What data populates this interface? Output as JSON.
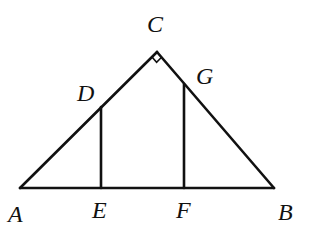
{
  "diagram": {
    "type": "geometry",
    "colors": {
      "stroke": "#111111",
      "background": "#ffffff"
    },
    "points": {
      "A": {
        "label": "A",
        "x": 20,
        "y": 188,
        "lx": 8,
        "ly": 222
      },
      "B": {
        "label": "B",
        "x": 274,
        "y": 188,
        "lx": 278,
        "ly": 220
      },
      "C": {
        "label": "C",
        "x": 157,
        "y": 52,
        "lx": 147,
        "ly": 32
      },
      "D": {
        "label": "D",
        "x": 101,
        "y": 107,
        "lx": 77,
        "ly": 101
      },
      "E": {
        "label": "E",
        "x": 101,
        "y": 188,
        "lx": 92,
        "ly": 218
      },
      "F": {
        "label": "F",
        "x": 184,
        "y": 188,
        "lx": 176,
        "ly": 218
      },
      "G": {
        "label": "G",
        "x": 184,
        "y": 84,
        "lx": 196,
        "ly": 84
      }
    },
    "segments": [
      {
        "name": "segment-AB",
        "from": "A",
        "to": "B"
      },
      {
        "name": "segment-AC",
        "from": "A",
        "to": "C"
      },
      {
        "name": "segment-CB",
        "from": "C",
        "to": "B"
      },
      {
        "name": "segment-DE",
        "from": "D",
        "to": "E"
      },
      {
        "name": "segment-GF",
        "from": "G",
        "to": "F"
      }
    ],
    "right_angle_marks": [
      {
        "vertex": "C"
      }
    ]
  }
}
